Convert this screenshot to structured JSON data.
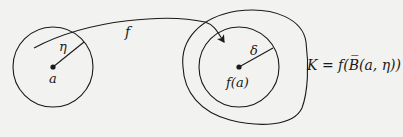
{
  "diagram": {
    "type": "mathematical-mapping",
    "background": "#f2f2f0",
    "stroke_color": "#1a1a1a",
    "left_ball": {
      "center_label": "a",
      "radius_label": "η"
    },
    "map": {
      "label": "f"
    },
    "right_ball": {
      "center_label": "f(a)",
      "radius_label": "δ"
    },
    "image_set": {
      "label": "K = f(B̅(a, η))"
    }
  }
}
